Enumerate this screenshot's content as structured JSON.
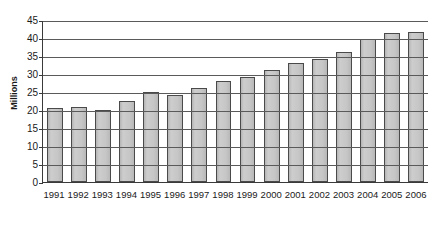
{
  "chart_data": {
    "type": "bar",
    "title": "",
    "subtitle": "",
    "xlabel": "",
    "ylabel": "Millions",
    "ylim": [
      0,
      45
    ],
    "ytick_step": 5,
    "yticks": [
      45,
      40,
      35,
      30,
      25,
      20,
      15,
      10,
      5,
      0
    ],
    "grid": "horizontal",
    "legend": "none",
    "categories": [
      "1991",
      "1992",
      "1993",
      "1994",
      "1995",
      "1996",
      "1997",
      "1998",
      "1999",
      "2000",
      "2001",
      "2002",
      "2003",
      "2004",
      "2005",
      "2006"
    ],
    "values": [
      20.6,
      20.8,
      20.0,
      22.6,
      25.0,
      24.2,
      26.0,
      28.0,
      29.3,
      31.0,
      33.0,
      34.1,
      36.2,
      39.7,
      41.5,
      41.8
    ],
    "series": [
      {
        "name": "Millions",
        "values": [
          20.6,
          20.8,
          20.0,
          22.6,
          25.0,
          24.2,
          26.0,
          28.0,
          29.3,
          31.0,
          33.0,
          34.1,
          36.2,
          39.7,
          41.5,
          41.8
        ]
      }
    ],
    "colors": {
      "bar_fill": "#c4c4c4",
      "bar_border": "#4a4a4a",
      "gridline": "#5a5a5a",
      "axis": "#3a3a3a",
      "text": "#1a1a1a",
      "background": "#ffffff"
    }
  }
}
